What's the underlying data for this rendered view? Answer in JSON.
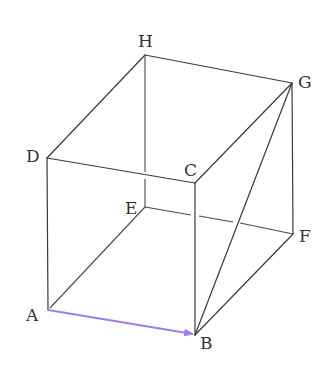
{
  "figure": {
    "type": "rectangular-prism",
    "vertices": {
      "A": {
        "label": "A",
        "x": 48,
        "y": 310,
        "lx": 26,
        "ly": 321
      },
      "B": {
        "label": "B",
        "x": 195,
        "y": 335,
        "lx": 200,
        "ly": 349
      },
      "C": {
        "label": "C",
        "x": 195,
        "y": 183,
        "lx": 186,
        "ly": 176
      },
      "D": {
        "label": "D",
        "x": 47,
        "y": 158,
        "lx": 26,
        "ly": 162
      },
      "E": {
        "label": "E",
        "x": 145,
        "y": 207,
        "lx": 125,
        "ly": 214
      },
      "F": {
        "label": "F",
        "x": 293,
        "y": 234,
        "lx": 299,
        "ly": 242
      },
      "G": {
        "label": "G",
        "x": 292,
        "y": 83,
        "lx": 298,
        "ly": 88
      },
      "H": {
        "label": "H",
        "x": 145,
        "y": 55,
        "lx": 138,
        "ly": 47
      }
    },
    "vector": {
      "from": "A",
      "to": "B",
      "color": "#a07cf0"
    },
    "line_color": "#3a3a3a"
  }
}
